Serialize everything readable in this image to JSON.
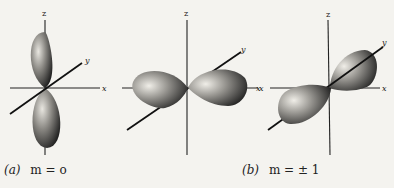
{
  "figure": {
    "panels": [
      {
        "id": "a",
        "description": "p orbital lobes along z axis",
        "axes": {
          "z": "z",
          "y": "y",
          "x": "x"
        }
      },
      {
        "id": "b1",
        "description": "p orbital lobes along x axis",
        "axes": {
          "z": "z",
          "y": "y",
          "x": "x"
        }
      },
      {
        "id": "b2",
        "description": "p orbital lobes along y axis",
        "axes": {
          "z": "z",
          "y": "y",
          "x": "x"
        }
      }
    ],
    "captions": {
      "a": {
        "tag": "(a)",
        "text": "m = o"
      },
      "b": {
        "tag": "(b)",
        "text": "m = ± 1"
      }
    }
  }
}
